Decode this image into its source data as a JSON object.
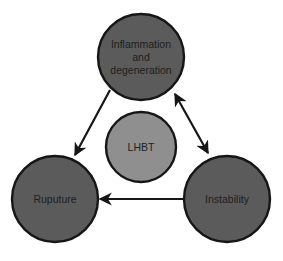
{
  "diagram": {
    "type": "cycle",
    "center": {
      "id": "lhbt",
      "label": "LHBT",
      "fill": "#8f8f8f"
    },
    "nodes": [
      {
        "id": "inflammation",
        "label_lines": [
          "Inflammation",
          "and",
          "degeneration"
        ],
        "fill": "#5b5b5b"
      },
      {
        "id": "rupture",
        "label": "Ruputure",
        "fill": "#5b5b5b"
      },
      {
        "id": "instability",
        "label": "Instability",
        "fill": "#5b5b5b"
      }
    ],
    "edges": [
      {
        "from": "inflammation",
        "to": "rupture",
        "direction": "forward"
      },
      {
        "from": "inflammation",
        "to": "instability",
        "direction": "bidirectional"
      },
      {
        "from": "instability",
        "to": "rupture",
        "direction": "forward"
      }
    ],
    "colors": {
      "stroke": "#161616",
      "outer_fill": "#5b5b5b",
      "center_fill": "#8f8f8f",
      "background": "#ffffff"
    }
  }
}
